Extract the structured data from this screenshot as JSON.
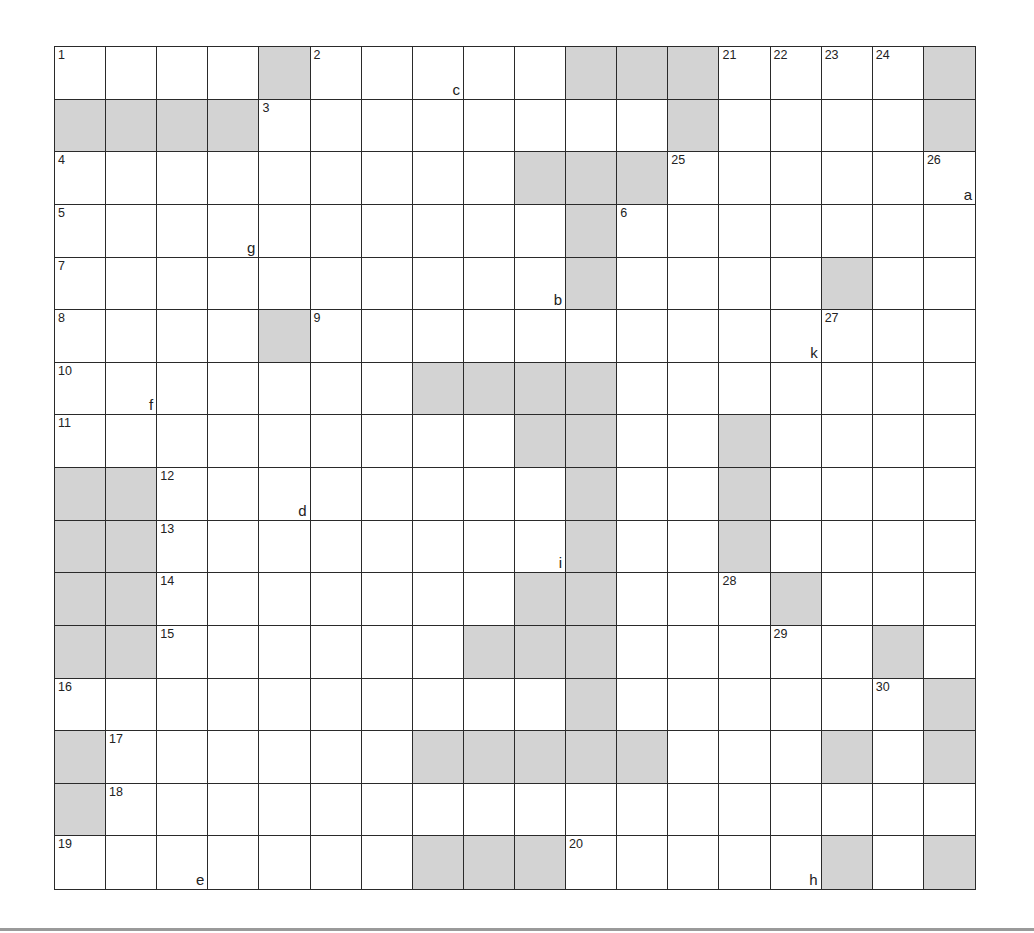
{
  "puzzle": {
    "rows": 16,
    "cols": 18,
    "colors": {
      "block": "#d3d3d3",
      "line": "#2a2a2a",
      "background": "#ffffff",
      "rule": "#9a9a9a"
    },
    "blocks": [
      [
        0,
        4
      ],
      [
        0,
        10
      ],
      [
        0,
        11
      ],
      [
        0,
        12
      ],
      [
        0,
        17
      ],
      [
        1,
        0
      ],
      [
        1,
        1
      ],
      [
        1,
        2
      ],
      [
        1,
        3
      ],
      [
        1,
        12
      ],
      [
        1,
        17
      ],
      [
        2,
        9
      ],
      [
        2,
        10
      ],
      [
        2,
        11
      ],
      [
        3,
        10
      ],
      [
        4,
        10
      ],
      [
        4,
        15
      ],
      [
        5,
        4
      ],
      [
        6,
        7
      ],
      [
        6,
        8
      ],
      [
        6,
        9
      ],
      [
        6,
        10
      ],
      [
        7,
        9
      ],
      [
        7,
        10
      ],
      [
        7,
        13
      ],
      [
        8,
        0
      ],
      [
        8,
        1
      ],
      [
        8,
        10
      ],
      [
        8,
        13
      ],
      [
        9,
        0
      ],
      [
        9,
        1
      ],
      [
        9,
        10
      ],
      [
        9,
        13
      ],
      [
        10,
        0
      ],
      [
        10,
        1
      ],
      [
        10,
        9
      ],
      [
        10,
        10
      ],
      [
        10,
        14
      ],
      [
        11,
        0
      ],
      [
        11,
        1
      ],
      [
        11,
        8
      ],
      [
        11,
        9
      ],
      [
        11,
        10
      ],
      [
        11,
        16
      ],
      [
        12,
        10
      ],
      [
        12,
        17
      ],
      [
        13,
        0
      ],
      [
        13,
        7
      ],
      [
        13,
        8
      ],
      [
        13,
        9
      ],
      [
        13,
        10
      ],
      [
        13,
        11
      ],
      [
        13,
        15
      ],
      [
        13,
        17
      ],
      [
        14,
        0
      ],
      [
        15,
        7
      ],
      [
        15,
        8
      ],
      [
        15,
        9
      ],
      [
        15,
        15
      ],
      [
        15,
        17
      ]
    ],
    "numbers": [
      {
        "r": 0,
        "c": 0,
        "n": "1"
      },
      {
        "r": 0,
        "c": 5,
        "n": "2"
      },
      {
        "r": 0,
        "c": 13,
        "n": "21"
      },
      {
        "r": 0,
        "c": 14,
        "n": "22"
      },
      {
        "r": 0,
        "c": 15,
        "n": "23"
      },
      {
        "r": 0,
        "c": 16,
        "n": "24"
      },
      {
        "r": 1,
        "c": 4,
        "n": "3"
      },
      {
        "r": 2,
        "c": 0,
        "n": "4"
      },
      {
        "r": 2,
        "c": 12,
        "n": "25"
      },
      {
        "r": 2,
        "c": 17,
        "n": "26"
      },
      {
        "r": 3,
        "c": 0,
        "n": "5"
      },
      {
        "r": 3,
        "c": 11,
        "n": "6"
      },
      {
        "r": 4,
        "c": 0,
        "n": "7"
      },
      {
        "r": 5,
        "c": 0,
        "n": "8"
      },
      {
        "r": 5,
        "c": 5,
        "n": "9"
      },
      {
        "r": 5,
        "c": 15,
        "n": "27"
      },
      {
        "r": 6,
        "c": 0,
        "n": "10"
      },
      {
        "r": 7,
        "c": 0,
        "n": "11"
      },
      {
        "r": 8,
        "c": 2,
        "n": "12"
      },
      {
        "r": 9,
        "c": 2,
        "n": "13"
      },
      {
        "r": 10,
        "c": 2,
        "n": "14"
      },
      {
        "r": 10,
        "c": 13,
        "n": "28"
      },
      {
        "r": 11,
        "c": 2,
        "n": "15"
      },
      {
        "r": 11,
        "c": 14,
        "n": "29"
      },
      {
        "r": 12,
        "c": 0,
        "n": "16"
      },
      {
        "r": 12,
        "c": 16,
        "n": "30"
      },
      {
        "r": 13,
        "c": 1,
        "n": "17"
      },
      {
        "r": 14,
        "c": 1,
        "n": "18"
      },
      {
        "r": 15,
        "c": 0,
        "n": "19"
      },
      {
        "r": 15,
        "c": 10,
        "n": "20"
      }
    ],
    "letters": [
      {
        "r": 0,
        "c": 7,
        "l": "c"
      },
      {
        "r": 2,
        "c": 17,
        "l": "a"
      },
      {
        "r": 3,
        "c": 3,
        "l": "g"
      },
      {
        "r": 4,
        "c": 9,
        "l": "b"
      },
      {
        "r": 5,
        "c": 14,
        "l": "k"
      },
      {
        "r": 6,
        "c": 1,
        "l": "f"
      },
      {
        "r": 8,
        "c": 4,
        "l": "d"
      },
      {
        "r": 9,
        "c": 9,
        "l": "i"
      },
      {
        "r": 15,
        "c": 2,
        "l": "e"
      },
      {
        "r": 15,
        "c": 14,
        "l": "h"
      }
    ]
  }
}
